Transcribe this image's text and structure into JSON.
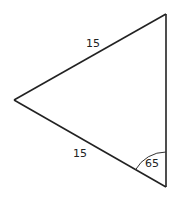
{
  "diagram": {
    "type": "triangle",
    "vertices": {
      "top": {
        "x": 166,
        "y": 14
      },
      "left": {
        "x": 14,
        "y": 100
      },
      "bottom": {
        "x": 166,
        "y": 187
      }
    },
    "sides": [
      {
        "name": "top-side",
        "from": "left",
        "to": "top",
        "label": "15"
      },
      {
        "name": "bottom-side",
        "from": "left",
        "to": "bottom",
        "label": "15"
      },
      {
        "name": "right-side",
        "from": "top",
        "to": "bottom",
        "label": ""
      }
    ],
    "angles": [
      {
        "vertex": "bottom",
        "label": "65",
        "arc_radius": 35
      }
    ],
    "labels": {
      "top_side": "15",
      "bottom_side": "15",
      "bottom_angle": "65"
    },
    "colors": {
      "stroke": "#222222",
      "background": "#ffffff"
    }
  }
}
